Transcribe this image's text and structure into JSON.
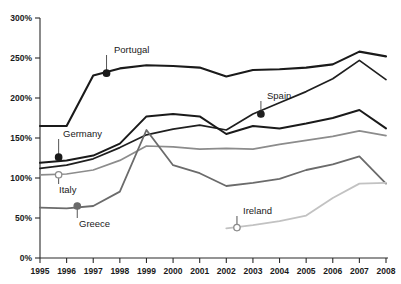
{
  "chart_data": {
    "type": "line",
    "title": "",
    "xlabel": "",
    "ylabel": "",
    "x": [
      1995,
      1996,
      1997,
      1998,
      1999,
      2000,
      2001,
      2002,
      2003,
      2004,
      2005,
      2006,
      2007,
      2008
    ],
    "categories": [
      "1995",
      "1996",
      "1997",
      "1998",
      "1999",
      "2000",
      "2001",
      "2002",
      "2003",
      "2004",
      "2005",
      "2006",
      "2007",
      "2008"
    ],
    "ylim": [
      0,
      300
    ],
    "yticks": [
      0,
      50,
      100,
      150,
      200,
      250,
      300
    ],
    "ytick_labels": [
      "0%",
      "50%",
      "100%",
      "150%",
      "200%",
      "250%",
      "300%"
    ],
    "grid": false,
    "legend": "none",
    "series": [
      {
        "name": "Portugal",
        "color": "#1a1a1a",
        "width": 2.1,
        "values": [
          165,
          165,
          228,
          237,
          241,
          240,
          238,
          227,
          235,
          236,
          238,
          242,
          258,
          252
        ],
        "marker": {
          "year": 1997.5,
          "value": 231,
          "style": "filled"
        },
        "label_x": 114,
        "label_y": 53
      },
      {
        "name": "Spain",
        "color": "#1f1f1f",
        "width": 1.7,
        "values": [
          112,
          116,
          124,
          138,
          154,
          161,
          166,
          160,
          180,
          194,
          208,
          224,
          247,
          223
        ],
        "marker": {
          "year": 2003.3,
          "value": 180,
          "style": "filled"
        },
        "label_x": 267,
        "label_y": 99
      },
      {
        "name": "Germany",
        "color": "#1a1a1a",
        "width": 2.0,
        "values": [
          119,
          122,
          128,
          143,
          177,
          180,
          177,
          155,
          165,
          162,
          168,
          175,
          185,
          162
        ],
        "marker": {
          "year": 1995.7,
          "value": 126,
          "style": "filled"
        },
        "label_x": 63,
        "label_y": 137
      },
      {
        "name": "Italy",
        "color": "#8c8c8c",
        "width": 1.7,
        "values": [
          104,
          105,
          110,
          122,
          140,
          139,
          136,
          137,
          136,
          142,
          147,
          152,
          159,
          153
        ],
        "marker": {
          "year": 1995.7,
          "value": 104,
          "style": "hollow"
        },
        "label_x": 59,
        "label_y": 193
      },
      {
        "name": "Greece",
        "color": "#6b6b6b",
        "width": 1.8,
        "values": [
          63,
          62,
          65,
          83,
          160,
          116,
          106,
          90,
          94,
          99,
          110,
          117,
          127,
          93
        ],
        "marker": {
          "year": 1996.4,
          "value": 65,
          "style": "filled"
        },
        "label_x": 79,
        "label_y": 227
      },
      {
        "name": "Ireland",
        "color": "#c2c2c2",
        "width": 1.8,
        "values": [
          null,
          null,
          null,
          null,
          null,
          null,
          null,
          37,
          41,
          46,
          53,
          75,
          93,
          94
        ],
        "marker": {
          "year": 2002.4,
          "value": 38,
          "style": "hollow"
        },
        "label_x": 243,
        "label_y": 214
      }
    ]
  }
}
